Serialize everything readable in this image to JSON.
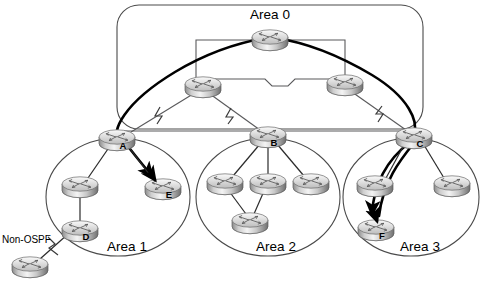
{
  "diagram": {
    "title_visible": false,
    "background": "#ffffff",
    "areas": [
      {
        "id": "area0",
        "label": "Area 0",
        "shape": "rounded-rect",
        "x": 117,
        "y": 5,
        "w": 306,
        "h": 124,
        "r": 22,
        "label_x": 270,
        "label_y": 19
      },
      {
        "id": "area1",
        "label": "Area 1",
        "shape": "ellipse",
        "cx": 118,
        "cy": 197,
        "rx": 72,
        "ry": 59,
        "label_x": 127,
        "label_y": 251
      },
      {
        "id": "area2",
        "label": "Area 2",
        "shape": "ellipse",
        "cx": 268,
        "cy": 197,
        "rx": 72,
        "ry": 59,
        "label_x": 276,
        "label_y": 251
      },
      {
        "id": "area3",
        "label": "Area 3",
        "shape": "ellipse",
        "cx": 411,
        "cy": 197,
        "rx": 68,
        "ry": 59,
        "label_x": 420,
        "label_y": 251
      }
    ],
    "routers": [
      {
        "id": "bb-top",
        "label": "",
        "x": 270,
        "y": 38,
        "scale": 1.0,
        "label_dx": 0,
        "label_dy": 0
      },
      {
        "id": "bb-left",
        "label": "",
        "x": 203,
        "y": 85,
        "scale": 1.0,
        "label_dx": 0,
        "label_dy": 0
      },
      {
        "id": "bb-right",
        "label": "",
        "x": 345,
        "y": 83,
        "scale": 1.0,
        "label_dx": 0,
        "label_dy": 0
      },
      {
        "id": "abr-a",
        "label": "A",
        "x": 117,
        "y": 138,
        "scale": 1.0,
        "label_dx": 6,
        "label_dy": 11
      },
      {
        "id": "abr-b",
        "label": "B",
        "x": 268,
        "y": 135,
        "scale": 1.0,
        "label_dx": 6,
        "label_dy": 11
      },
      {
        "id": "abr-c",
        "label": "C",
        "x": 414,
        "y": 136,
        "scale": 1.0,
        "label_dx": 6,
        "label_dy": 11
      },
      {
        "id": "a1-r1",
        "label": "",
        "x": 80,
        "y": 185,
        "scale": 1.0,
        "label_dx": 0,
        "label_dy": 0
      },
      {
        "id": "a1-d",
        "label": "D",
        "x": 80,
        "y": 229,
        "scale": 1.0,
        "label_dx": 6,
        "label_dy": 11
      },
      {
        "id": "a1-e",
        "label": "E",
        "x": 163,
        "y": 187,
        "scale": 1.0,
        "label_dx": 6,
        "label_dy": 11
      },
      {
        "id": "ext-router",
        "label": "",
        "x": 30,
        "y": 265,
        "scale": 1.0,
        "label_dx": 0,
        "label_dy": 0
      },
      {
        "id": "a2-r1",
        "label": "",
        "x": 225,
        "y": 182,
        "scale": 1.0,
        "label_dx": 0,
        "label_dy": 0
      },
      {
        "id": "a2-r2",
        "label": "",
        "x": 268,
        "y": 182,
        "scale": 1.0,
        "label_dx": 0,
        "label_dy": 0
      },
      {
        "id": "a2-r3",
        "label": "",
        "x": 311,
        "y": 182,
        "scale": 1.0,
        "label_dx": 0,
        "label_dy": 0
      },
      {
        "id": "a2-r4",
        "label": "",
        "x": 250,
        "y": 221,
        "scale": 1.0,
        "label_dx": 0,
        "label_dy": 0
      },
      {
        "id": "a3-r1",
        "label": "",
        "x": 375,
        "y": 184,
        "scale": 1.0,
        "label_dx": 0,
        "label_dy": 0
      },
      {
        "id": "a3-r2",
        "label": "",
        "x": 452,
        "y": 184,
        "scale": 1.0,
        "label_dx": 0,
        "label_dy": 0
      },
      {
        "id": "a3-f",
        "label": "F",
        "x": 376,
        "y": 228,
        "scale": 1.0,
        "label_dx": 6,
        "label_dy": 11
      }
    ],
    "external_label": {
      "text": "Non-OSPF",
      "x": 2,
      "y": 243
    },
    "serial_link_marker": "lightning-bolt",
    "link_count_thin": 14,
    "link_count_bold": 4,
    "colors": {
      "boundary_stroke": "#4a4a4a",
      "thin_link": "#59595b",
      "bold_link": "#000000",
      "router_body_light": "#f2f2f2",
      "router_body_mid": "#b9b9b9",
      "router_body_dark": "#7d7d7d",
      "text": "#000000",
      "background": "#ffffff"
    }
  }
}
